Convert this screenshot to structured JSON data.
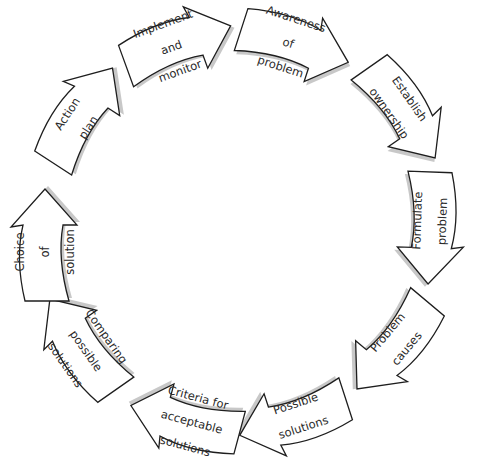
{
  "diagram": {
    "type": "cycle",
    "direction": "clockwise",
    "colors": {
      "fill": "#ffffff",
      "stroke": "#1e1e1e",
      "shadow": "#9a9a9a",
      "text": "#2a2a2a"
    },
    "steps": [
      {
        "label": "Awareness of problem",
        "lines": [
          "Awareness",
          "of",
          "problem"
        ],
        "x": 295,
        "y": 45,
        "angle": 18
      },
      {
        "label": "Establish ownership",
        "lines": [
          "Establish",
          "ownership"
        ],
        "x": 403,
        "y": 112,
        "angle": 55
      },
      {
        "label": "Formulate problem",
        "lines": [
          "Formulate",
          "problem"
        ],
        "x": 430,
        "y": 228,
        "angle": 92
      },
      {
        "label": "Problem causes",
        "lines": [
          "Problem",
          "causes"
        ],
        "x": 393,
        "y": 346,
        "angle": 130
      },
      {
        "label": "Possible solutions",
        "lines": [
          "Possible",
          "solutions"
        ],
        "x": 293,
        "y": 418,
        "angle": 162
      },
      {
        "label": "Criteria for acceptable solutions",
        "lines": [
          "Criteria for",
          "acceptable",
          "solutions"
        ],
        "x": 185,
        "y": 420,
        "angle": 195
      },
      {
        "label": "Comparing possible solutions",
        "lines": [
          "Comparing",
          "possible",
          "solutions"
        ],
        "x": 82,
        "y": 345,
        "angle": 235
      },
      {
        "label": "Choice of solution",
        "lines": [
          "Choice",
          "of",
          "solution"
        ],
        "x": 45,
        "y": 245,
        "angle": 270
      },
      {
        "label": "Action plan",
        "lines": [
          "Action",
          "plan"
        ],
        "x": 82,
        "y": 115,
        "angle": 303
      },
      {
        "label": "Implement and monitor",
        "lines": [
          "Implement",
          "and",
          "monitor"
        ],
        "x": 178,
        "y": 45,
        "angle": 340
      }
    ]
  }
}
